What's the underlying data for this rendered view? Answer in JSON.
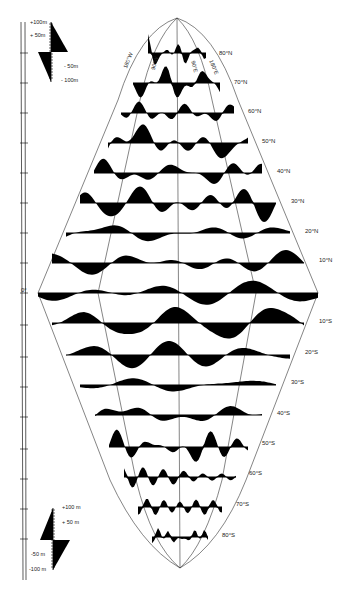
{
  "figure": {
    "type": "diamond-projection profile diagram",
    "ink_color": "#000000",
    "background": "#ffffff"
  },
  "longitude_labels": [
    {
      "text": "180°W",
      "x": 122,
      "y": 70,
      "rot": -68
    },
    {
      "text": "90°W",
      "x": 150,
      "y": 72,
      "rot": -75
    },
    {
      "text": "90°E",
      "x": 196,
      "y": 63,
      "rot": 75
    },
    {
      "text": "180°E",
      "x": 214,
      "y": 62,
      "rot": 68
    }
  ],
  "latitude_labels": [
    {
      "text": "80°N",
      "x": 219,
      "y": 53
    },
    {
      "text": "70°N",
      "x": 234,
      "y": 82
    },
    {
      "text": "60°N",
      "x": 248,
      "y": 111
    },
    {
      "text": "50°N",
      "x": 262,
      "y": 141
    },
    {
      "text": "40°N",
      "x": 277,
      "y": 171
    },
    {
      "text": "30°N",
      "x": 291,
      "y": 201
    },
    {
      "text": "20°N",
      "x": 305,
      "y": 231
    },
    {
      "text": "10°N",
      "x": 319,
      "y": 260
    },
    {
      "text": "10°S",
      "x": 319,
      "y": 321
    },
    {
      "text": "20°S",
      "x": 305,
      "y": 352
    },
    {
      "text": "30°S",
      "x": 291,
      "y": 382
    },
    {
      "text": "40°S",
      "x": 277,
      "y": 413
    },
    {
      "text": "50°S",
      "x": 262,
      "y": 443
    },
    {
      "text": "60°S",
      "x": 249,
      "y": 473
    },
    {
      "text": "70°S",
      "x": 236,
      "y": 504
    },
    {
      "text": "80°S",
      "x": 222,
      "y": 535
    }
  ],
  "equator_label": {
    "text": "0°",
    "x": 21,
    "y": 290
  },
  "scale_top": {
    "labels": [
      {
        "text": "+100m",
        "x": 30,
        "y": 22
      },
      {
        "text": "+ 50m",
        "x": 30,
        "y": 35
      },
      {
        "text": "- 50m",
        "x": 64,
        "y": 66
      },
      {
        "text": "- 100m",
        "x": 61,
        "y": 80
      }
    ]
  },
  "scale_bottom": {
    "labels": [
      {
        "text": "+100 m",
        "x": 62,
        "y": 507
      },
      {
        "text": "+ 50 m",
        "x": 62,
        "y": 522
      },
      {
        "text": "-50 m",
        "x": 31,
        "y": 554
      },
      {
        "text": "-100 m",
        "x": 29,
        "y": 569
      }
    ]
  },
  "bands": [
    {
      "lat": "80°N",
      "y": 53,
      "x0": 148,
      "x1": 206
    },
    {
      "lat": "70°N",
      "y": 83,
      "x0": 133,
      "x1": 220
    },
    {
      "lat": "60°N",
      "y": 113,
      "x0": 121,
      "x1": 234
    },
    {
      "lat": "50°N",
      "y": 143,
      "x0": 108,
      "x1": 248
    },
    {
      "lat": "40°N",
      "y": 173,
      "x0": 94,
      "x1": 262
    },
    {
      "lat": "30°N",
      "y": 203,
      "x0": 80,
      "x1": 276
    },
    {
      "lat": "20°N",
      "y": 233,
      "x0": 66,
      "x1": 290
    },
    {
      "lat": "10°N",
      "y": 263,
      "x0": 52,
      "x1": 304
    },
    {
      "lat": "0°",
      "y": 293,
      "x0": 38,
      "x1": 318
    },
    {
      "lat": "10°S",
      "y": 323,
      "x0": 52,
      "x1": 304
    },
    {
      "lat": "20°S",
      "y": 355,
      "x0": 66,
      "x1": 290
    },
    {
      "lat": "30°S",
      "y": 385,
      "x0": 80,
      "x1": 276
    },
    {
      "lat": "40°S",
      "y": 415,
      "x0": 95,
      "x1": 262
    },
    {
      "lat": "50°S",
      "y": 447,
      "x0": 109,
      "x1": 248
    },
    {
      "lat": "60°S",
      "y": 477,
      "x0": 124,
      "x1": 236
    },
    {
      "lat": "70°S",
      "y": 507,
      "x0": 138,
      "x1": 222
    },
    {
      "lat": "80°S",
      "y": 537,
      "x0": 152,
      "x1": 208
    }
  ]
}
